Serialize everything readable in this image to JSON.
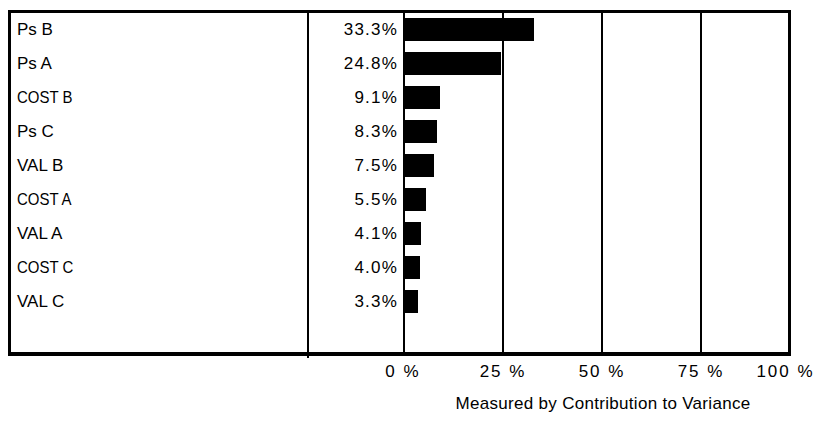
{
  "chart_data": {
    "type": "bar",
    "orientation": "horizontal",
    "title": "",
    "xlabel": "Measured by Contribution to Variance",
    "ylabel": "",
    "xlim": [
      0,
      100
    ],
    "xticks": [
      0,
      25,
      50,
      75,
      100
    ],
    "xtick_labels": [
      "0 %",
      "25 %",
      "50 %",
      "75 %",
      "100 %"
    ],
    "grid": true,
    "legend": "none",
    "bar_color": "#000000",
    "background_color": "#ffffff",
    "categories": [
      "Ps B",
      "Ps A",
      "COST B",
      "Ps C",
      "VAL B",
      "COST A",
      "VAL A",
      "COST C",
      "VAL C"
    ],
    "values": [
      33.3,
      24.8,
      9.1,
      8.3,
      7.5,
      5.5,
      4.1,
      4.0,
      3.3
    ],
    "value_labels": [
      "33.3%",
      "24.8%",
      "9.1%",
      "8.3%",
      "7.5%",
      "5.5%",
      "4.1%",
      "4.0%",
      "3.3%"
    ],
    "rows": [
      {
        "label": "Ps B",
        "value": 33.3,
        "value_label": "33.3%",
        "condensed": false
      },
      {
        "label": "Ps A",
        "value": 24.8,
        "value_label": "24.8%",
        "condensed": false
      },
      {
        "label": "COST B",
        "value": 9.1,
        "value_label": "9.1%",
        "condensed": true
      },
      {
        "label": "Ps C",
        "value": 8.3,
        "value_label": "8.3%",
        "condensed": false
      },
      {
        "label": "VAL B",
        "value": 7.5,
        "value_label": "7.5%",
        "condensed": false
      },
      {
        "label": "COST A",
        "value": 5.5,
        "value_label": "5.5%",
        "condensed": true
      },
      {
        "label": "VAL A",
        "value": 4.1,
        "value_label": "4.1%",
        "condensed": false
      },
      {
        "label": "COST C",
        "value": 4.0,
        "value_label": "4.0%",
        "condensed": true
      },
      {
        "label": "VAL C",
        "value": 3.3,
        "value_label": "3.3%",
        "condensed": false
      }
    ]
  }
}
